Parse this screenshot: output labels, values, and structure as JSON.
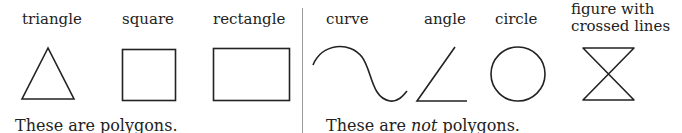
{
  "polygons": {
    "labels": {
      "triangle": "triangle",
      "square": "square",
      "rectangle": "rectangle"
    },
    "caption": "These are polygons."
  },
  "non_polygons": {
    "labels": {
      "curve": "curve",
      "angle": "angle",
      "circle": "circle",
      "crossed_line1": "figure with",
      "crossed_line2": "crossed lines"
    },
    "caption_pre": "These are ",
    "caption_em": "not",
    "caption_post": " polygons."
  },
  "colors": {
    "stroke": "#222222",
    "divider": "#999999",
    "background": "#ffffff"
  }
}
